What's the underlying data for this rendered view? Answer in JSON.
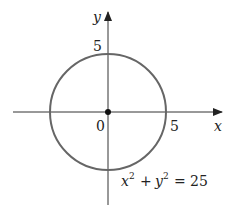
{
  "figure": {
    "axes": {
      "x_label": "x",
      "y_label": "y",
      "origin_label": "0",
      "x_tick_label": "5",
      "y_tick_label": "5"
    },
    "circle": {
      "center": [
        0,
        0
      ],
      "radius": 5,
      "color": "#666666"
    },
    "equation": {
      "lhs_x": "x",
      "lhs_y": "y",
      "exp": "2",
      "plus": "+",
      "equals": "=",
      "rhs": "25"
    }
  }
}
